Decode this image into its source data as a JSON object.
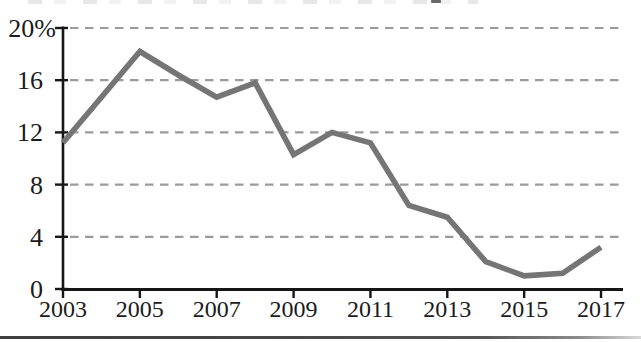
{
  "chart_data": {
    "type": "line",
    "title": "",
    "xlabel": "",
    "ylabel": "",
    "x": [
      2003,
      2004,
      2005,
      2006,
      2007,
      2008,
      2009,
      2010,
      2011,
      2012,
      2013,
      2014,
      2015,
      2016,
      2017
    ],
    "series": [
      {
        "name": "percentage",
        "values": [
          11.2,
          14.7,
          18.2,
          16.4,
          14.7,
          15.8,
          10.3,
          12.0,
          11.2,
          6.4,
          5.5,
          2.1,
          1.0,
          1.2,
          3.2
        ]
      }
    ],
    "xlim": [
      2003,
      2017
    ],
    "ylim": [
      0,
      20
    ],
    "x_ticks": [
      2003,
      2005,
      2007,
      2009,
      2011,
      2013,
      2015,
      2017
    ],
    "x_tick_labels": [
      "2003",
      "2005",
      "2007",
      "2009",
      "2011",
      "2013",
      "2015",
      "2017"
    ],
    "y_ticks": [
      20,
      16,
      12,
      8,
      4,
      0
    ],
    "y_tick_labels": [
      "20%",
      "16",
      "12",
      "8",
      "4",
      "0"
    ],
    "grid": "horizontal-dashed",
    "legend": "none",
    "colors": {
      "line": "#757575",
      "gridline": "#9b9b9b",
      "axis": "#161616",
      "tick_label": "#1b1b1b",
      "background": "#ffffff"
    }
  }
}
